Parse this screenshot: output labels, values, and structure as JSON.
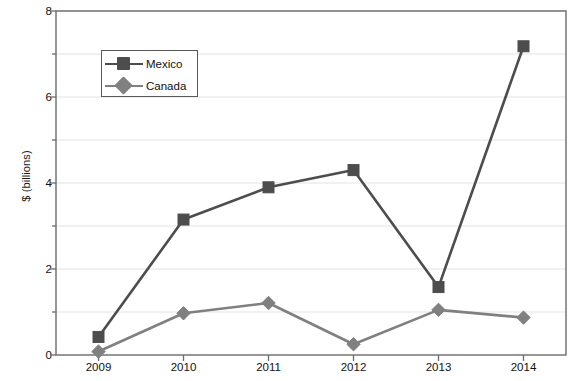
{
  "chart_data": {
    "type": "line",
    "title": "",
    "subtitle": "",
    "xlabel": "",
    "ylabel": "$ (billions)",
    "categories": [
      "2009",
      "2010",
      "2011",
      "2012",
      "2013",
      "2014"
    ],
    "x": [
      2009,
      2010,
      2011,
      2012,
      2013,
      2014
    ],
    "series": [
      {
        "name": "Mexico",
        "values": [
          0.42,
          3.15,
          3.9,
          4.3,
          1.58,
          7.18
        ],
        "color": "#4d4d4d",
        "marker": "square"
      },
      {
        "name": "Canada",
        "values": [
          0.08,
          0.97,
          1.21,
          0.25,
          1.05,
          0.87
        ],
        "color": "#808080",
        "marker": "diamond"
      }
    ],
    "ylim": [
      0,
      8
    ],
    "y_major_ticks": [
      0,
      2,
      4,
      6,
      8
    ],
    "y_major_tick_labels": [
      "0",
      "2",
      "4",
      "6",
      "8"
    ],
    "y_minor_ticks": [
      1,
      3,
      5,
      7
    ],
    "grid": true,
    "grid_color": "#e3e3e3",
    "axis_color": "#6b6b6b",
    "plot_background": "#ffffff",
    "legend": {
      "position": "upper-left-inside",
      "entries": [
        "Mexico",
        "Canada"
      ]
    }
  }
}
